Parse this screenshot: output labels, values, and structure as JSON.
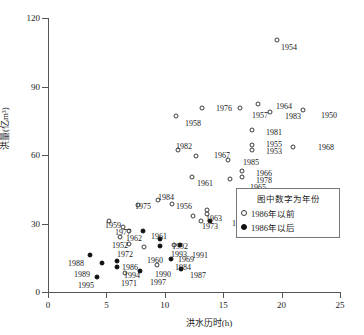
{
  "chart_data": {
    "type": "scatter",
    "title": "",
    "xlabel": "洪水历时(h)",
    "ylabel": "洪量(亿m³)",
    "xlim": [
      0,
      25
    ],
    "ylim": [
      0,
      120
    ],
    "xticks": [
      0,
      5,
      10,
      15,
      20,
      25
    ],
    "yticks": [
      0,
      30,
      60,
      90,
      120
    ],
    "grid": false,
    "legend": {
      "position": "inside-right",
      "title": "图中数字为年份",
      "entries": [
        {
          "marker": "open",
          "label": "1986年以前"
        },
        {
          "marker": "filled",
          "label": "1986年以后"
        }
      ]
    },
    "series": [
      {
        "name": "1986年以前",
        "marker": "open",
        "points": [
          {
            "label": "1954",
            "x": 19.6,
            "y": 110.5
          },
          {
            "label": "1976",
            "x": 13.2,
            "y": 80.5
          },
          {
            "label": "1958",
            "x": 11.0,
            "y": 77.0
          },
          {
            "label": "1957",
            "x": 16.4,
            "y": 80.5
          },
          {
            "label": "1964",
            "x": 18.0,
            "y": 82.5
          },
          {
            "label": "1983",
            "x": 19.0,
            "y": 79.0
          },
          {
            "label": "1950",
            "x": 21.8,
            "y": 79.5
          },
          {
            "label": "1981",
            "x": 17.5,
            "y": 71.0
          },
          {
            "label": "1955",
            "x": 17.5,
            "y": 64.5
          },
          {
            "label": "1953",
            "x": 17.5,
            "y": 62.0
          },
          {
            "label": "1968",
            "x": 21.0,
            "y": 63.5
          },
          {
            "label": "1982",
            "x": 11.1,
            "y": 62.0
          },
          {
            "label": "1967",
            "x": 12.7,
            "y": 59.5
          },
          {
            "label": "1985",
            "x": 15.4,
            "y": 58.0
          },
          {
            "label": "1966",
            "x": 16.6,
            "y": 53.0
          },
          {
            "label": "1978",
            "x": 16.6,
            "y": 50.5
          },
          {
            "label": "1965",
            "x": 15.6,
            "y": 49.5
          },
          {
            "label": "1961",
            "x": 12.3,
            "y": 50.5
          },
          {
            "label": "1984",
            "x": 9.4,
            "y": 40.5
          },
          {
            "label": "1975",
            "x": 7.7,
            "y": 38.0
          },
          {
            "label": "1956",
            "x": 10.6,
            "y": 38.5
          },
          {
            "label": "1970",
            "x": 13.6,
            "y": 36.0
          },
          {
            "label": "1979",
            "x": 13.6,
            "y": 34.0
          },
          {
            "label": "1963",
            "x": 12.4,
            "y": 33.5
          },
          {
            "label": "1959",
            "x": 5.2,
            "y": 31.0
          },
          {
            "label": "1977",
            "x": 6.4,
            "y": 28.5
          },
          {
            "label": "1962",
            "x": 6.9,
            "y": 26.5
          },
          {
            "label": "1952",
            "x": 6.2,
            "y": 24.0
          },
          {
            "label": "1972",
            "x": 6.9,
            "y": 21.0
          },
          {
            "label": "1973",
            "x": 13.1,
            "y": 31.0
          },
          {
            "label": "1960",
            "x": 8.2,
            "y": 19.5
          },
          {
            "label": "1969",
            "x": 10.8,
            "y": 20.5
          },
          {
            "label": "1990",
            "x": 9.3,
            "y": 12.0
          },
          {
            "label": "1971",
            "x": 6.6,
            "y": 8.5
          }
        ]
      },
      {
        "name": "1986年以后",
        "marker": "filled",
        "points": [
          {
            "label": "1996",
            "x": 13.9,
            "y": 31.0
          },
          {
            "label": "1961b",
            "x": 8.1,
            "y": 26.5
          },
          {
            "label": "1992",
            "x": 9.6,
            "y": 23.0
          },
          {
            "label": "1993",
            "x": 9.6,
            "y": 20.0
          },
          {
            "label": "1991",
            "x": 11.3,
            "y": 20.5
          },
          {
            "label": "1984b",
            "x": 10.5,
            "y": 14.5
          },
          {
            "label": "1988",
            "x": 3.6,
            "y": 16.0
          },
          {
            "label": "1989",
            "x": 4.6,
            "y": 12.5
          },
          {
            "label": "1986",
            "x": 5.9,
            "y": 13.5
          },
          {
            "label": "1994",
            "x": 5.9,
            "y": 11.0
          },
          {
            "label": "1997",
            "x": 7.9,
            "y": 9.0
          },
          {
            "label": "1995",
            "x": 4.2,
            "y": 6.5
          },
          {
            "label": "1987",
            "x": 11.4,
            "y": 10.0
          }
        ]
      }
    ],
    "annotations": [
      {
        "text": "1954",
        "x": 281,
        "y": 44
      },
      {
        "text": "1976",
        "x": 216,
        "y": 105
      },
      {
        "text": "1958",
        "x": 185,
        "y": 120
      },
      {
        "text": "1957",
        "x": 252,
        "y": 112
      },
      {
        "text": "1964",
        "x": 276,
        "y": 103
      },
      {
        "text": "1983",
        "x": 285,
        "y": 113
      },
      {
        "text": "1950",
        "x": 321,
        "y": 112
      },
      {
        "text": "1981",
        "x": 266,
        "y": 129
      },
      {
        "text": "1955",
        "x": 266,
        "y": 141
      },
      {
        "text": "1953",
        "x": 266,
        "y": 148
      },
      {
        "text": "1968",
        "x": 318,
        "y": 144
      },
      {
        "text": "1982",
        "x": 176,
        "y": 143
      },
      {
        "text": "1967",
        "x": 214,
        "y": 152
      },
      {
        "text": "1985",
        "x": 243,
        "y": 159
      },
      {
        "text": "1966",
        "x": 256,
        "y": 170
      },
      {
        "text": "1978",
        "x": 256,
        "y": 177
      },
      {
        "text": "1965",
        "x": 250,
        "y": 184
      },
      {
        "text": "1961",
        "x": 197,
        "y": 180
      },
      {
        "text": "1984",
        "x": 158,
        "y": 194
      },
      {
        "text": "1975",
        "x": 135,
        "y": 203
      },
      {
        "text": "1956",
        "x": 176,
        "y": 203
      },
      {
        "text": "1970",
        "x": 240,
        "y": 205
      },
      {
        "text": "1979",
        "x": 240,
        "y": 213
      },
      {
        "text": "1963",
        "x": 206,
        "y": 215
      },
      {
        "text": "1996",
        "x": 232,
        "y": 220
      },
      {
        "text": "1973",
        "x": 202,
        "y": 223
      },
      {
        "text": "1959",
        "x": 105,
        "y": 222
      },
      {
        "text": "1977",
        "x": 115,
        "y": 229
      },
      {
        "text": "1962",
        "x": 126,
        "y": 235
      },
      {
        "text": "1961",
        "x": 151,
        "y": 233
      },
      {
        "text": "1952",
        "x": 112,
        "y": 242
      },
      {
        "text": "1992",
        "x": 172,
        "y": 243
      },
      {
        "text": "1972",
        "x": 117,
        "y": 251
      },
      {
        "text": "1993",
        "x": 171,
        "y": 251
      },
      {
        "text": "1991",
        "x": 192,
        "y": 252
      },
      {
        "text": "1960",
        "x": 147,
        "y": 257
      },
      {
        "text": "1969",
        "x": 178,
        "y": 256
      },
      {
        "text": "1988",
        "x": 68,
        "y": 260
      },
      {
        "text": "1984",
        "x": 175,
        "y": 264
      },
      {
        "text": "1987",
        "x": 190,
        "y": 272
      },
      {
        "text": "1986",
        "x": 122,
        "y": 264
      },
      {
        "text": "1989",
        "x": 74,
        "y": 271
      },
      {
        "text": "1994",
        "x": 124,
        "y": 272
      },
      {
        "text": "1990",
        "x": 155,
        "y": 271
      },
      {
        "text": "1971",
        "x": 121,
        "y": 280
      },
      {
        "text": "1997",
        "x": 150,
        "y": 279
      },
      {
        "text": "1995",
        "x": 78,
        "y": 282
      }
    ]
  }
}
